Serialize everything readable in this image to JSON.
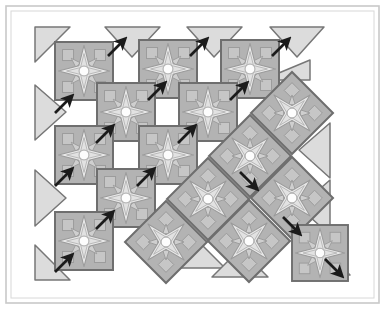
{
  "figure": {
    "title": "Tiling transformation diagram",
    "canvas": {
      "width": 385,
      "height": 309
    },
    "frame": {
      "outer": {
        "x": 6,
        "y": 6,
        "width": 373,
        "height": 297,
        "stroke": "#c9c9c9",
        "fill": "#ffffff"
      },
      "inner": {
        "x": 11,
        "y": 11,
        "width": 363,
        "height": 287,
        "stroke": "#d8d8d8"
      }
    },
    "colors": {
      "background": "#ffffff",
      "tile_border": "#6e6e6e",
      "tile_field": "#b3b3b3",
      "star_fill": "#e2e2e2",
      "star_outline": "#9a9a9a",
      "corner_motif": "#c6c6c6",
      "center_dot": "#fdfdfd",
      "triangle_fill": "#dcdcdc",
      "triangle_stroke": "#777777",
      "arrow": "#1b1b1b",
      "frame_outer": "#c9c9c9",
      "frame_inner": "#d8d8d8"
    },
    "legend_note": "",
    "star_tiles": [
      {
        "name": "star-tile-1",
        "cx": 84,
        "cy": 71,
        "r": 29,
        "rotation": 0
      },
      {
        "name": "star-tile-2",
        "cx": 168,
        "cy": 69,
        "r": 29,
        "rotation": 0
      },
      {
        "name": "star-tile-3",
        "cx": 250,
        "cy": 69,
        "r": 29,
        "rotation": 0
      },
      {
        "name": "star-tile-4",
        "cx": 126,
        "cy": 112,
        "r": 29,
        "rotation": 0
      },
      {
        "name": "star-tile-5",
        "cx": 208,
        "cy": 112,
        "r": 29,
        "rotation": 0
      },
      {
        "name": "star-tile-6",
        "cx": 84,
        "cy": 155,
        "r": 29,
        "rotation": 0
      },
      {
        "name": "star-tile-7",
        "cx": 168,
        "cy": 155,
        "r": 29,
        "rotation": 0
      },
      {
        "name": "star-tile-8",
        "cx": 126,
        "cy": 198,
        "r": 29,
        "rotation": 0
      },
      {
        "name": "star-tile-9",
        "cx": 84,
        "cy": 241,
        "r": 29,
        "rotation": 0
      },
      {
        "name": "star-tile-10",
        "cx": 292,
        "cy": 113,
        "r": 29,
        "rotation": 45
      },
      {
        "name": "star-tile-11",
        "cx": 250,
        "cy": 156,
        "r": 29,
        "rotation": 45
      },
      {
        "name": "star-tile-12",
        "cx": 208,
        "cy": 199,
        "r": 29,
        "rotation": 45
      },
      {
        "name": "star-tile-13",
        "cx": 166,
        "cy": 242,
        "r": 29,
        "rotation": 45
      },
      {
        "name": "star-tile-14",
        "cx": 292,
        "cy": 198,
        "r": 29,
        "rotation": 45
      },
      {
        "name": "star-tile-15",
        "cx": 249,
        "cy": 241,
        "r": 29,
        "rotation": 45
      },
      {
        "name": "star-tile-16",
        "cx": 320,
        "cy": 253,
        "r": 28,
        "rotation": 0
      }
    ],
    "triangle_tiles": [
      {
        "name": "triangle-top-left-corner",
        "points": "35,27 70,27 35,62",
        "shape": "right-triangle"
      },
      {
        "name": "triangle-top-1",
        "points": "105,27 160,27 132,57",
        "shape": "down-pointing"
      },
      {
        "name": "triangle-top-2",
        "points": "187,27 242,27 214,57",
        "shape": "down-pointing"
      },
      {
        "name": "triangle-top-3",
        "points": "270,27 324,27 297,57",
        "shape": "down-pointing"
      },
      {
        "name": "triangle-left-1",
        "points": "35,85 35,140 66,112",
        "shape": "right-pointing"
      },
      {
        "name": "triangle-left-2",
        "points": "35,170 35,226 66,198",
        "shape": "right-pointing"
      },
      {
        "name": "triangle-bottom-left",
        "points": "35,245 35,280 70,280",
        "shape": "right-triangle"
      },
      {
        "name": "triangle-strip-1",
        "points": "262,80 310,80 310,60",
        "shape": "sliver"
      },
      {
        "name": "triangle-right-1",
        "points": "330,123 330,178 299,150",
        "shape": "left-pointing"
      },
      {
        "name": "triangle-right-2",
        "points": "330,180 330,235 299,207",
        "shape": "left-pointing"
      },
      {
        "name": "triangle-diag-1",
        "points": "128,240 183,240 155,212",
        "shape": "up-pointing"
      },
      {
        "name": "triangle-diag-2",
        "points": "169,268 225,268 197,240",
        "shape": "up-pointing"
      },
      {
        "name": "triangle-diag-3",
        "points": "212,277 268,277 240,249",
        "shape": "up-pointing"
      },
      {
        "name": "triangle-bottom-right",
        "points": "322,247 350,275 322,275",
        "shape": "right-triangle"
      }
    ],
    "arrows": [
      {
        "name": "arrow-ne-1",
        "x1": 108,
        "y1": 56,
        "x2": 125,
        "y2": 39,
        "direction": "northeast"
      },
      {
        "name": "arrow-ne-2",
        "x1": 190,
        "y1": 56,
        "x2": 207,
        "y2": 39,
        "direction": "northeast"
      },
      {
        "name": "arrow-ne-3",
        "x1": 272,
        "y1": 56,
        "x2": 289,
        "y2": 39,
        "direction": "northeast"
      },
      {
        "name": "arrow-ne-4",
        "x1": 55,
        "y1": 113,
        "x2": 72,
        "y2": 96,
        "direction": "northeast"
      },
      {
        "name": "arrow-ne-5",
        "x1": 148,
        "y1": 100,
        "x2": 165,
        "y2": 83,
        "direction": "northeast"
      },
      {
        "name": "arrow-ne-6",
        "x1": 230,
        "y1": 100,
        "x2": 247,
        "y2": 83,
        "direction": "northeast"
      },
      {
        "name": "arrow-ne-7",
        "x1": 96,
        "y1": 143,
        "x2": 113,
        "y2": 126,
        "direction": "northeast"
      },
      {
        "name": "arrow-ne-8",
        "x1": 178,
        "y1": 143,
        "x2": 195,
        "y2": 126,
        "direction": "northeast"
      },
      {
        "name": "arrow-ne-9",
        "x1": 55,
        "y1": 186,
        "x2": 72,
        "y2": 169,
        "direction": "northeast"
      },
      {
        "name": "arrow-ne-10",
        "x1": 137,
        "y1": 186,
        "x2": 154,
        "y2": 169,
        "direction": "northeast"
      },
      {
        "name": "arrow-ne-11",
        "x1": 96,
        "y1": 229,
        "x2": 113,
        "y2": 212,
        "direction": "northeast"
      },
      {
        "name": "arrow-ne-12",
        "x1": 55,
        "y1": 272,
        "x2": 72,
        "y2": 255,
        "direction": "northeast"
      },
      {
        "name": "arrow-se-1",
        "x1": 240,
        "y1": 172,
        "x2": 257,
        "y2": 189,
        "direction": "southeast"
      },
      {
        "name": "arrow-se-2",
        "x1": 283,
        "y1": 217,
        "x2": 300,
        "y2": 234,
        "direction": "southeast"
      },
      {
        "name": "arrow-se-3",
        "x1": 325,
        "y1": 259,
        "x2": 342,
        "y2": 276,
        "direction": "southeast"
      }
    ],
    "counts": {
      "star_tiles": 16,
      "triangle_tiles": 14,
      "arrows_northeast": 12,
      "arrows_southeast": 3
    }
  }
}
